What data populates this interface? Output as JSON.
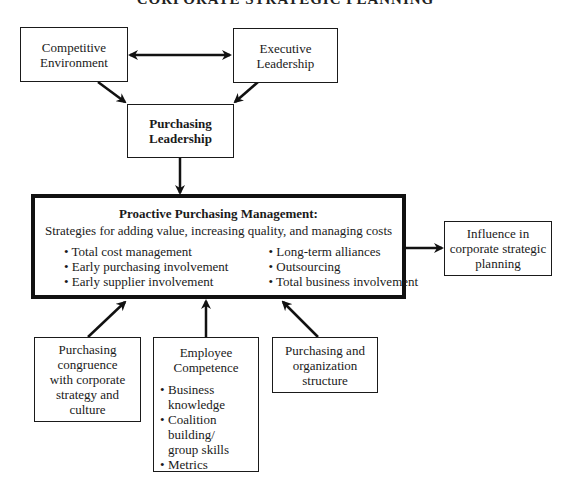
{
  "title": "CORPORATE STRATEGIC PLANNING",
  "nodes": {
    "competitive_environment": {
      "lines": [
        "Competitive",
        "Environment"
      ]
    },
    "executive_leadership": {
      "lines": [
        "Executive",
        "Leadership"
      ]
    },
    "purchasing_leadership": {
      "lines": [
        "Purchasing",
        "Leadership"
      ]
    },
    "proactive_management": {
      "heading": "Proactive Purchasing Management:",
      "subtitle": "Strategies for adding value, increasing quality, and managing costs",
      "left_items": [
        "• Total cost management",
        "• Early purchasing involvement",
        "• Early supplier involvement"
      ],
      "right_items": [
        "• Long-term alliances",
        "• Outsourcing",
        "• Total business involvement"
      ]
    },
    "influence": {
      "lines": [
        "Influence in",
        "corporate strategic",
        "planning"
      ]
    },
    "congruence": {
      "lines": [
        "Purchasing",
        "congruence",
        "with corporate",
        "strategy and",
        "culture"
      ]
    },
    "employee_competence": {
      "lines": [
        "Employee",
        "Competence"
      ],
      "items": [
        "Business knowledge",
        "Coalition building/ group skills",
        "Metrics"
      ]
    },
    "organization_structure": {
      "lines": [
        "Purchasing and",
        "organization",
        "structure"
      ]
    }
  },
  "edges": [
    {
      "from": "competitive_environment",
      "to": "executive_leadership",
      "type": "bidirectional"
    },
    {
      "from": "competitive_environment",
      "to": "purchasing_leadership",
      "type": "directed"
    },
    {
      "from": "executive_leadership",
      "to": "purchasing_leadership",
      "type": "directed"
    },
    {
      "from": "purchasing_leadership",
      "to": "proactive_management",
      "type": "directed"
    },
    {
      "from": "proactive_management",
      "to": "influence",
      "type": "directed"
    },
    {
      "from": "congruence",
      "to": "proactive_management",
      "type": "directed"
    },
    {
      "from": "employee_competence",
      "to": "proactive_management",
      "type": "directed"
    },
    {
      "from": "organization_structure",
      "to": "proactive_management",
      "type": "directed"
    }
  ],
  "colors": {
    "line": "#111111",
    "background": "#ffffff"
  }
}
